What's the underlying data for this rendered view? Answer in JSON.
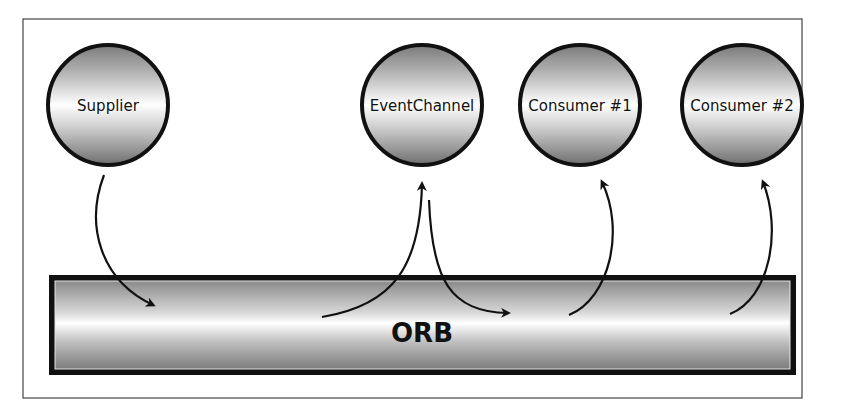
{
  "diagram": {
    "nodes": [
      {
        "id": "supplier",
        "label": "Supplier"
      },
      {
        "id": "event-channel",
        "label": "EventChannel"
      },
      {
        "id": "consumer-1",
        "label": "Consumer #1"
      },
      {
        "id": "consumer-2",
        "label": "Consumer #2"
      }
    ],
    "bus": {
      "label": "ORB"
    },
    "flows": [
      {
        "from": "Supplier",
        "to": "ORB"
      },
      {
        "from": "ORB",
        "to": "EventChannel"
      },
      {
        "from": "EventChannel",
        "to": "ORB"
      },
      {
        "from": "ORB",
        "to": "Consumer #1"
      },
      {
        "from": "ORB",
        "to": "Consumer #2"
      }
    ]
  }
}
